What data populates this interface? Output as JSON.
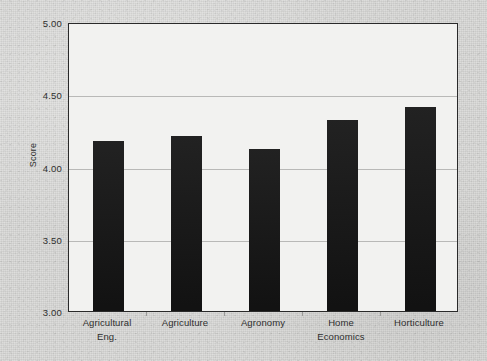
{
  "chart_data": {
    "type": "bar",
    "title": "",
    "subtitle": "",
    "xlabel": "",
    "ylabel": "Score",
    "ylim": [
      3.0,
      5.0
    ],
    "yticks": [
      "5.00",
      "4.50",
      "4.00",
      "3.50",
      "3.00"
    ],
    "ytick_values": [
      5.0,
      4.5,
      4.0,
      3.5,
      3.0
    ],
    "grid": "horizontal",
    "legend": "none",
    "bar_color": "#141414",
    "plot_background": "#f2f2f0",
    "page_background": "#d8d8d6",
    "axis_color": "#2a2a2a",
    "gridline_color": "#b9b9b7",
    "categories": [
      "Agricultural Eng.",
      "Agriculture",
      "Agronomy",
      "Home Economics",
      "Horticulture"
    ],
    "category_lines": [
      [
        "Agricultural",
        "Eng."
      ],
      [
        "Agriculture"
      ],
      [
        "Agronomy"
      ],
      [
        "Home",
        "Economics"
      ],
      [
        "Horticulture"
      ]
    ],
    "values": [
      4.18,
      4.21,
      4.12,
      4.32,
      4.41
    ]
  }
}
